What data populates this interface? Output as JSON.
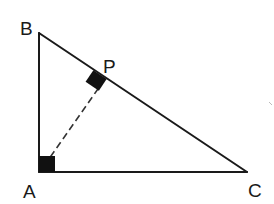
{
  "diagram": {
    "type": "geometry-figure",
    "points": {
      "A": {
        "label": "A"
      },
      "B": {
        "label": "B"
      },
      "C": {
        "label": "C"
      },
      "P": {
        "label": "P"
      }
    },
    "segments": [
      {
        "from": "A",
        "to": "B",
        "style": "solid"
      },
      {
        "from": "A",
        "to": "C",
        "style": "solid"
      },
      {
        "from": "B",
        "to": "C",
        "style": "solid"
      },
      {
        "from": "A",
        "to": "P",
        "style": "dashed"
      }
    ],
    "right_angles": [
      "A",
      "P"
    ],
    "colors": {
      "line": "#1a1a1a",
      "marker": "#111111",
      "background": "#ffffff"
    }
  }
}
